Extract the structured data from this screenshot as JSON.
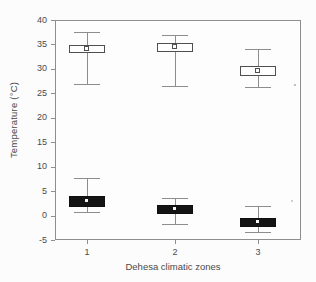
{
  "chart_data": {
    "type": "box",
    "title": "",
    "xlabel": "Dehesa climatic zones",
    "ylabel": "Temperature (°C)",
    "categories": [
      "1",
      "2",
      "3"
    ],
    "ylim": [
      -5,
      40
    ],
    "yticks": [
      40,
      35,
      30,
      25,
      20,
      15,
      10,
      5,
      0,
      -5
    ],
    "grid": false,
    "legend": "none",
    "series": [
      {
        "name": "maximum-temperature",
        "box_style": "white",
        "fill": "#fefefe",
        "mean_marker": "open-square",
        "boxes": [
          {
            "category": "1",
            "whisker_low": 27.0,
            "q1": 33.2,
            "mean": 34.2,
            "q3": 34.8,
            "whisker_high": 37.6
          },
          {
            "category": "2",
            "whisker_low": 26.5,
            "q1": 33.5,
            "mean": 34.5,
            "q3": 35.2,
            "whisker_high": 37.0
          },
          {
            "category": "3",
            "whisker_low": 26.3,
            "q1": 28.5,
            "mean": 29.7,
            "q3": 30.5,
            "whisker_high": 34.0
          }
        ]
      },
      {
        "name": "minimum-temperature",
        "box_style": "black",
        "fill": "#141414",
        "mean_marker": "white-square",
        "boxes": [
          {
            "category": "1",
            "whisker_low": 0.8,
            "q1": 1.8,
            "mean": 3.0,
            "q3": 3.9,
            "whisker_high": 7.6
          },
          {
            "category": "2",
            "whisker_low": -1.8,
            "q1": 0.4,
            "mean": 1.4,
            "q3": 2.1,
            "whisker_high": 3.6
          },
          {
            "category": "3",
            "whisker_low": -3.3,
            "q1": -2.3,
            "mean": -1.3,
            "q3": -0.5,
            "whisker_high": 2.0
          }
        ]
      }
    ]
  },
  "colors": {
    "background": "#fcfcfc",
    "frame": "#8f8f8f",
    "whisker": "#8d8d8d",
    "black_box": "#141414",
    "white_box": "#fefefe",
    "text": "#4a4a4a"
  }
}
